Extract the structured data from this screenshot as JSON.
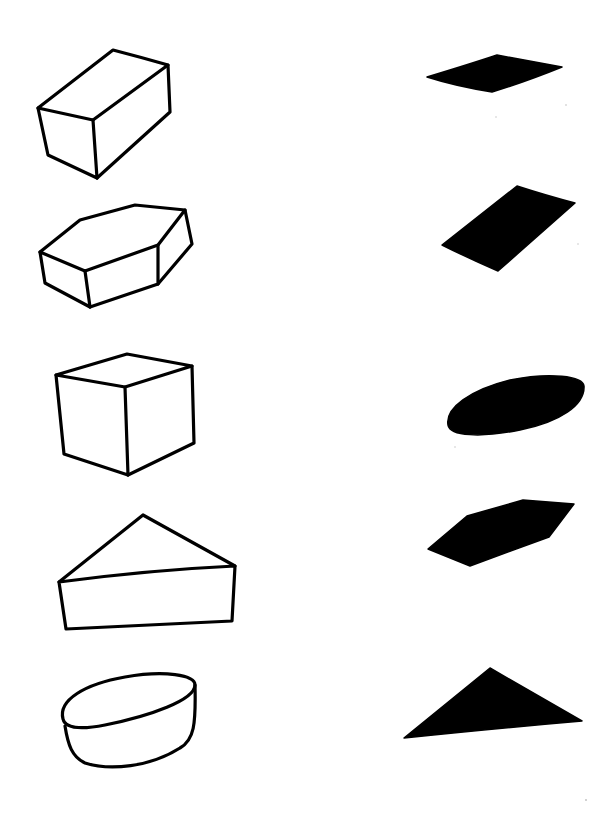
{
  "page": {
    "background": "#ffffff",
    "ink_color": "#000000"
  },
  "left_column": {
    "items": [
      {
        "id": "rectangular-prism",
        "label": "Rectangular prism (cuboid) line drawing"
      },
      {
        "id": "hexagonal-prism",
        "label": "Hexagonal prism line drawing"
      },
      {
        "id": "cube",
        "label": "Cube line drawing"
      },
      {
        "id": "triangular-prism",
        "label": "Triangular prism line drawing"
      },
      {
        "id": "cylinder",
        "label": "Oval cylinder line drawing"
      }
    ]
  },
  "right_column": {
    "items": [
      {
        "id": "rhombus-shadow",
        "label": "Rhombus-shaped black silhouette"
      },
      {
        "id": "rectangle-shadow",
        "label": "Rectangle-shaped black silhouette"
      },
      {
        "id": "oval-shadow",
        "label": "Oval-shaped black silhouette"
      },
      {
        "id": "hexagon-shadow",
        "label": "Hexagon-shaped black silhouette"
      },
      {
        "id": "triangle-shadow",
        "label": "Triangle-shaped black silhouette"
      }
    ]
  }
}
